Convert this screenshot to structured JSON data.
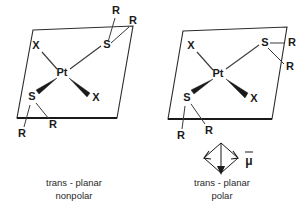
{
  "figure": {
    "background_color": "#ffffff",
    "line_color": "#2b2b2b",
    "text_color": "#1a1a1a"
  },
  "structures": [
    {
      "id": "left",
      "center_atom": "Pt",
      "ligands": {
        "top_left": "X",
        "top_right": "S",
        "bottom_left": "S",
        "bottom_right": "X"
      },
      "substituents": {
        "top_sulfur_r1": "R",
        "top_sulfur_r2": "R",
        "bottom_sulfur_r1": "R",
        "bottom_sulfur_r2": "R"
      },
      "caption_line1": "trans - planar",
      "caption_line2": "nonpolar",
      "has_dipole": false
    },
    {
      "id": "right",
      "center_atom": "Pt",
      "ligands": {
        "top_left": "X",
        "top_right": "S",
        "bottom_left": "S",
        "bottom_right": "X"
      },
      "substituents": {
        "top_sulfur_r1": "R",
        "top_sulfur_r2": "R",
        "bottom_sulfur_r1": "R",
        "bottom_sulfur_r2": "R"
      },
      "caption_line1": "trans - planar",
      "caption_line2": "polar",
      "has_dipole": true,
      "dipole_label": "μ"
    }
  ]
}
